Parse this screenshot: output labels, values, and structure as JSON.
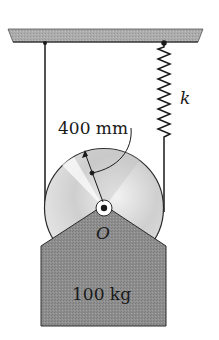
{
  "diagram": {
    "type": "pulley-spring-mass",
    "labels": {
      "radius": "400 mm",
      "spring_constant": "k",
      "center": "O",
      "mass": "100 kg"
    },
    "colors": {
      "ceiling_fill": "#a8a8a8",
      "block_fill": "#8c8c8c",
      "disc_fill": "#d9d9d9",
      "line": "#1a1a1a",
      "background": "#ffffff"
    }
  }
}
